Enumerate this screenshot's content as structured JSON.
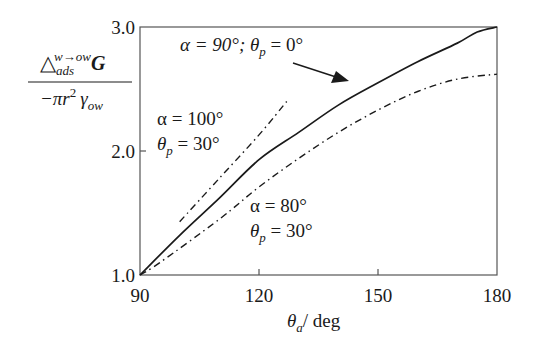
{
  "chart_data": {
    "type": "line",
    "title": "",
    "xlabel": "θ_a / deg",
    "ylabel": "Δ_ads^{w→ow} G / (−π r² γ_ow)",
    "xlim": [
      90,
      180
    ],
    "ylim": [
      1.0,
      3.0
    ],
    "x_ticks": [
      90,
      120,
      150,
      180
    ],
    "y_ticks": [
      1.0,
      2.0,
      3.0
    ],
    "x_tick_labels": [
      "90",
      "120",
      "150",
      "180"
    ],
    "y_tick_labels": [
      "1.0",
      "2.0",
      "3.0"
    ],
    "grid": false,
    "legend": "none (curves labelled inline)",
    "series": [
      {
        "name": "α = 90°; θp = 0°",
        "style": "solid",
        "x": [
          90,
          100,
          110,
          120,
          130,
          140,
          150,
          160,
          170,
          175,
          180
        ],
        "y": [
          1.0,
          1.32,
          1.62,
          1.93,
          2.15,
          2.37,
          2.55,
          2.72,
          2.87,
          2.96,
          3.0
        ]
      },
      {
        "name": "α = 100°; θp = 30°",
        "style": "dash-dot",
        "x": [
          100,
          110,
          120,
          127
        ],
        "y": [
          1.43,
          1.78,
          2.13,
          2.4
        ]
      },
      {
        "name": "α = 80°; θp = 30°",
        "style": "dash-dot",
        "x": [
          90,
          95,
          110,
          120,
          130,
          140,
          150,
          160,
          170,
          180
        ],
        "y": [
          1.0,
          1.1,
          1.45,
          1.71,
          1.94,
          2.15,
          2.33,
          2.48,
          2.58,
          2.62
        ]
      }
    ],
    "annotations": [
      {
        "text": "α = 90°; θp = 0°",
        "arrow_to": [
          141,
          2.56
        ]
      },
      {
        "text": "α = 100°\nθp = 30°"
      },
      {
        "text": "α = 80°\nθp = 30°"
      }
    ]
  },
  "labels": {
    "ylabel_num_delta": "△",
    "ylabel_num_sub": "ads",
    "ylabel_num_sup": "w→ow",
    "ylabel_num_G": "G",
    "ylabel_den_minus_pi": "−πr",
    "ylabel_den_sq": "2",
    "ylabel_den_gamma": "γ",
    "ylabel_den_sub": "ow",
    "xlabel_theta": "θ",
    "xlabel_sub": "a",
    "xlabel_unit": "/ deg",
    "ann1_alpha": "α = 90°; θ",
    "ann1_sub": "p",
    "ann1_rest": " = 0°",
    "ann2_line1": "α = 100°",
    "ann2_theta": "θ",
    "ann2_sub": "p",
    "ann2_rest": " = 30°",
    "ann3_line1": "α = 80°",
    "ann3_theta": "θ",
    "ann3_sub": "p",
    "ann3_rest": " = 30°"
  },
  "colors": {
    "ink": "#1a1a1a",
    "frame": "#555555",
    "background": "#ffffff"
  }
}
